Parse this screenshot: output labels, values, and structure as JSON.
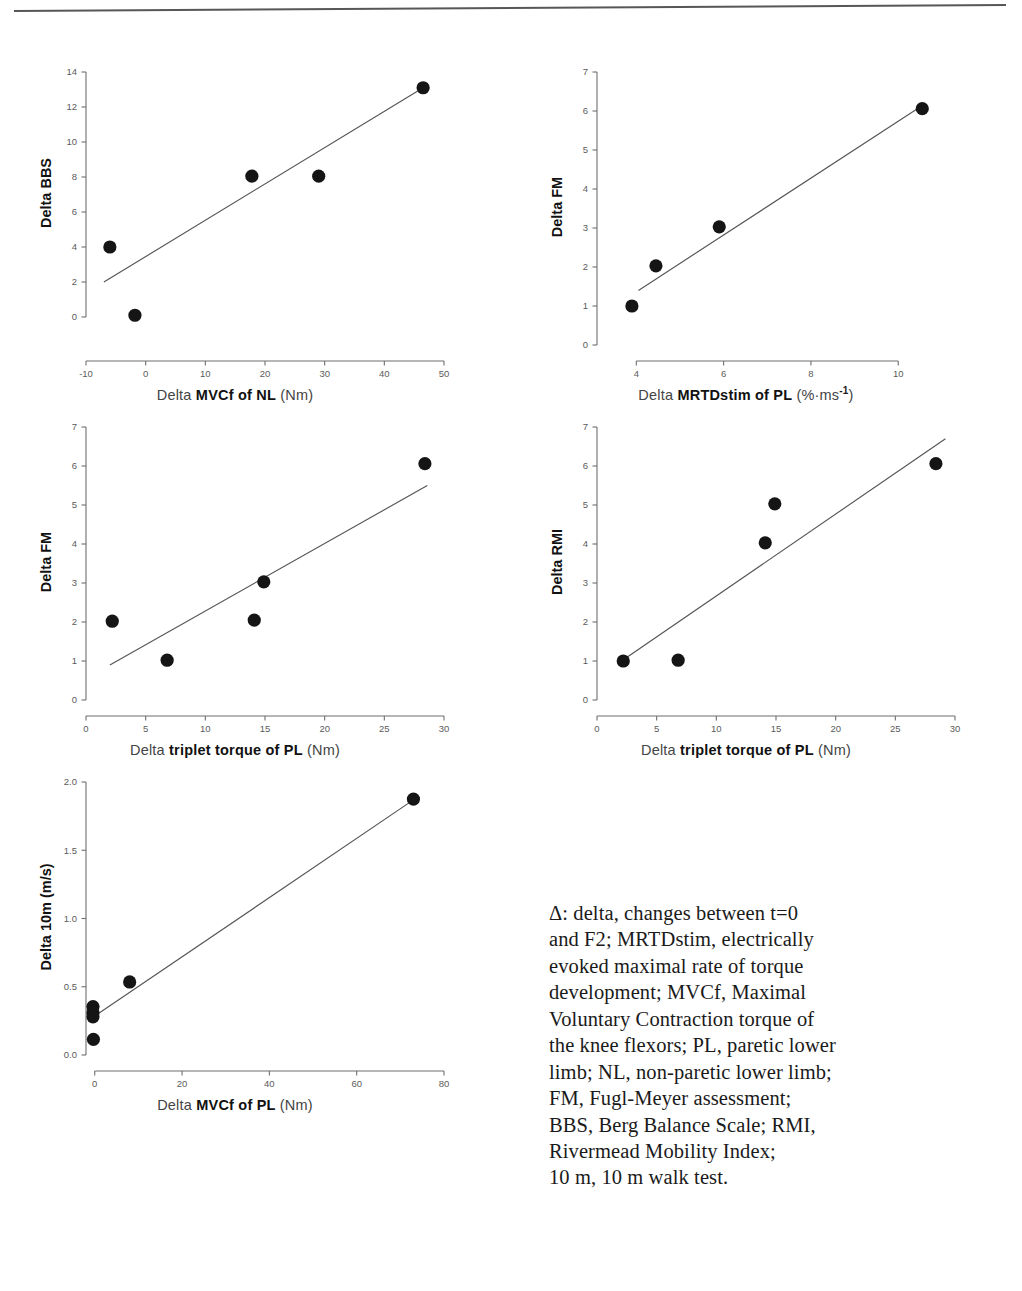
{
  "figure": {
    "top_rule": "horizontal-rule",
    "caption_lines": [
      "Δ: delta, changes between t=0",
      "and F2; MRTDstim, electrically",
      "evoked maximal rate of torque",
      "development; MVCf, Maximal",
      "Voluntary Contraction torque of",
      "the knee flexors; PL, paretic lower",
      "limb; NL, non-paretic lower limb;",
      "FM, Fugl-Meyer assessment;",
      "BBS, Berg Balance Scale; RMI,",
      "Rivermead Mobility Index;",
      "10 m, 10 m walk test."
    ]
  },
  "colors": {
    "marker": "#151515",
    "axis": "#6e6e6e",
    "trendline": "#555555",
    "text": "#1a1a1a",
    "tick_text": "#5b5b5b"
  },
  "chart_data": [
    {
      "id": "panel-bbs-vs-mvcf-nl",
      "type": "scatter",
      "title": "",
      "xlabel_lead": "Delta ",
      "xlabel_core": "MVCf of NL",
      "xlabel_unit": " (Nm)",
      "xlabel": "Delta MVCf of NL (Nm)",
      "ylabel": "Delta BBS",
      "xlim": [
        -10,
        50
      ],
      "ylim": [
        -1.6,
        14
      ],
      "xticks": [
        -10,
        0,
        10,
        20,
        30,
        40,
        50
      ],
      "xtick_labels": [
        "-10",
        "0",
        "10",
        "20",
        "30",
        "40",
        "50"
      ],
      "yticks": [
        0,
        2,
        4,
        6,
        8,
        10,
        12,
        14
      ],
      "ytick_labels": [
        "0",
        "2",
        "4",
        "6",
        "8",
        "10",
        "12",
        "14"
      ],
      "grid": false,
      "points": [
        {
          "x": -6.0,
          "y": 4.0
        },
        {
          "x": -1.8,
          "y": 0.1
        },
        {
          "x": 17.8,
          "y": 8.05
        },
        {
          "x": 29.0,
          "y": 8.05
        },
        {
          "x": 46.5,
          "y": 13.1
        }
      ],
      "trendline": {
        "x1": -7.0,
        "y1": 2.0,
        "x2": 46.5,
        "y2": 13.1
      }
    },
    {
      "id": "panel-fm-vs-mrtdstim-pl",
      "type": "scatter",
      "title": "",
      "xlabel_lead": "Delta ",
      "xlabel_core": "MRTDstim of PL",
      "xlabel_unit": " (%·ms",
      "xlabel_sup": "-1",
      "xlabel_unit_end": ")",
      "xlabel": "Delta MRTDstim of PL (%·ms-1)",
      "ylabel": "Delta FM",
      "xlim": [
        3.1,
        11.3
      ],
      "ylim": [
        0,
        7
      ],
      "xticks": [
        4,
        6,
        8,
        10
      ],
      "xtick_labels": [
        "4",
        "6",
        "8",
        "10"
      ],
      "yticks": [
        0,
        1,
        2,
        3,
        4,
        5,
        6,
        7
      ],
      "ytick_labels": [
        "0",
        "1",
        "2",
        "3",
        "4",
        "5",
        "6",
        "7"
      ],
      "grid": false,
      "points": [
        {
          "x": 3.9,
          "y": 1.0
        },
        {
          "x": 4.45,
          "y": 2.03
        },
        {
          "x": 5.9,
          "y": 3.03
        },
        {
          "x": 10.55,
          "y": 6.06
        }
      ],
      "trendline": {
        "x1": 4.05,
        "y1": 1.4,
        "x2": 10.5,
        "y2": 6.1
      }
    },
    {
      "id": "panel-fm-vs-triplet-torque-pl",
      "type": "scatter",
      "title": "",
      "xlabel_lead": "Delta ",
      "xlabel_core": "triplet torque of PL",
      "xlabel_unit": " (Nm)",
      "xlabel": "Delta triplet torque of PL (Nm)",
      "ylabel": "Delta FM",
      "xlim": [
        0,
        30
      ],
      "ylim": [
        0,
        7
      ],
      "xticks": [
        0,
        5,
        10,
        15,
        20,
        25,
        30
      ],
      "xtick_labels": [
        "0",
        "5",
        "10",
        "15",
        "20",
        "25",
        "30"
      ],
      "yticks": [
        0,
        1,
        2,
        3,
        4,
        5,
        6,
        7
      ],
      "ytick_labels": [
        "0",
        "1",
        "2",
        "3",
        "4",
        "5",
        "6",
        "7"
      ],
      "grid": false,
      "points": [
        {
          "x": 2.2,
          "y": 2.02
        },
        {
          "x": 6.8,
          "y": 1.02
        },
        {
          "x": 14.1,
          "y": 2.05
        },
        {
          "x": 14.9,
          "y": 3.03
        },
        {
          "x": 28.4,
          "y": 6.06
        }
      ],
      "trendline": {
        "x1": 2.0,
        "y1": 0.9,
        "x2": 28.6,
        "y2": 5.5
      }
    },
    {
      "id": "panel-rmi-vs-triplet-torque-pl",
      "type": "scatter",
      "title": "",
      "xlabel_lead": "Delta ",
      "xlabel_core": "triplet torque of PL",
      "xlabel_unit": " (Nm)",
      "xlabel": "Delta triplet torque of PL (Nm)",
      "ylabel": "Delta RMI",
      "xlim": [
        0,
        30
      ],
      "ylim": [
        0,
        7
      ],
      "xticks": [
        0,
        5,
        10,
        15,
        20,
        25,
        30
      ],
      "xtick_labels": [
        "0",
        "5",
        "10",
        "15",
        "20",
        "25",
        "30"
      ],
      "yticks": [
        0,
        1,
        2,
        3,
        4,
        5,
        6,
        7
      ],
      "ytick_labels": [
        "0",
        "1",
        "2",
        "3",
        "4",
        "5",
        "6",
        "7"
      ],
      "grid": false,
      "points": [
        {
          "x": 2.2,
          "y": 1.0
        },
        {
          "x": 6.8,
          "y": 1.02
        },
        {
          "x": 14.1,
          "y": 4.03
        },
        {
          "x": 14.9,
          "y": 5.03
        },
        {
          "x": 28.4,
          "y": 6.06
        }
      ],
      "trendline": {
        "x1": 2.3,
        "y1": 1.05,
        "x2": 29.2,
        "y2": 6.7
      }
    },
    {
      "id": "panel-10m-vs-mvcf-pl",
      "type": "scatter",
      "title": "",
      "xlabel_lead": "Delta ",
      "xlabel_core": "MVCf of PL",
      "xlabel_unit": " (Nm)",
      "xlabel": "Delta MVCf of PL (Nm)",
      "ylabel": "Delta 10m (m/s)",
      "xlim": [
        -2,
        80
      ],
      "ylim": [
        0.0,
        2.0
      ],
      "xticks": [
        0,
        20,
        40,
        60,
        80
      ],
      "xtick_labels": [
        "0",
        "20",
        "40",
        "60",
        "80"
      ],
      "yticks": [
        0.0,
        0.5,
        1.0,
        1.5,
        2.0
      ],
      "ytick_labels": [
        "0.0",
        "0.5",
        "1.0",
        "1.5",
        "2.0"
      ],
      "grid": false,
      "points": [
        {
          "x": -0.4,
          "y": 0.355
        },
        {
          "x": -0.4,
          "y": 0.31
        },
        {
          "x": -0.4,
          "y": 0.28
        },
        {
          "x": -0.3,
          "y": 0.115
        },
        {
          "x": 8.0,
          "y": 0.535
        },
        {
          "x": 73.0,
          "y": 1.875
        }
      ],
      "trendline": {
        "x1": 0.0,
        "y1": 0.285,
        "x2": 73.5,
        "y2": 1.88
      }
    }
  ]
}
